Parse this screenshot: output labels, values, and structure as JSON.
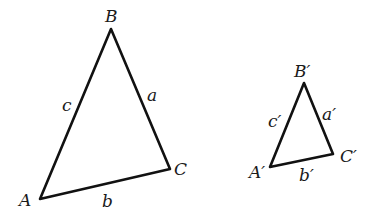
{
  "diagram": {
    "triangles": [
      {
        "id": "large",
        "vertices": [
          {
            "name": "A",
            "label": "A",
            "x": 40,
            "y": 199
          },
          {
            "name": "B",
            "label": "B",
            "x": 111,
            "y": 29
          },
          {
            "name": "C",
            "label": "C",
            "x": 170,
            "y": 169
          }
        ],
        "sides": [
          {
            "name": "a",
            "label": "a",
            "between": [
              "B",
              "C"
            ]
          },
          {
            "name": "b",
            "label": "b",
            "between": [
              "A",
              "C"
            ]
          },
          {
            "name": "c",
            "label": "c",
            "between": [
              "A",
              "B"
            ]
          }
        ]
      },
      {
        "id": "small",
        "vertices": [
          {
            "name": "A'",
            "label": "A′",
            "x": 270,
            "y": 167
          },
          {
            "name": "B'",
            "label": "B′",
            "x": 304,
            "y": 83
          },
          {
            "name": "C'",
            "label": "C′",
            "x": 333,
            "y": 154
          }
        ],
        "sides": [
          {
            "name": "a'",
            "label": "a′",
            "between": [
              "B'",
              "C'"
            ]
          },
          {
            "name": "b'",
            "label": "b′",
            "between": [
              "A'",
              "C'"
            ]
          },
          {
            "name": "c'",
            "label": "c′",
            "between": [
              "A'",
              "B'"
            ]
          }
        ]
      }
    ],
    "line_color": "#111111",
    "label_color": "#1a1a1a"
  },
  "labels": {
    "large": {
      "A": "A",
      "B": "B",
      "C": "C",
      "a": "a",
      "b": "b",
      "c": "c"
    },
    "small": {
      "A": "A′",
      "B": "B′",
      "C": "C′",
      "a": "a′",
      "b": "b′",
      "c": "c′"
    }
  }
}
